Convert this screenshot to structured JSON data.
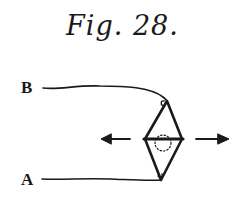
{
  "figure": {
    "title": "Fig. 28.",
    "labels": {
      "top_end": "B",
      "bottom_end": "A"
    },
    "colors": {
      "ink": "#1a1a1a",
      "background": "#ffffff"
    },
    "elements": {
      "strand_b": "thread from B to top of diamond",
      "strand_a": "thread from A to bottom of diamond",
      "diamond_frame": "rhombus loop with horizontal crossbar",
      "dotted_circle": "dotted circle at center",
      "arrow_left": "arrow pointing left",
      "arrow_right": "arrow pointing right"
    }
  }
}
